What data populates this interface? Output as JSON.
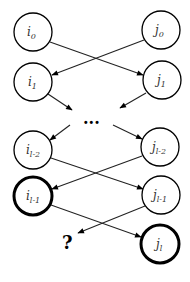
{
  "diagram": {
    "title": "",
    "nodes": [
      {
        "id": "i0",
        "base": "i",
        "sub": "0",
        "x": 33,
        "y": 32,
        "bold": false
      },
      {
        "id": "j0",
        "base": "j",
        "sub": "0",
        "x": 161,
        "y": 30,
        "bold": false
      },
      {
        "id": "i1",
        "base": "i",
        "sub": "1",
        "x": 33,
        "y": 82,
        "bold": false
      },
      {
        "id": "j1",
        "base": "j",
        "sub": "1",
        "x": 162,
        "y": 80,
        "bold": false
      },
      {
        "id": "il-2",
        "base": "i",
        "sub": "l-2",
        "x": 33,
        "y": 150,
        "bold": false
      },
      {
        "id": "jl-2",
        "base": "j",
        "sub": "l-2",
        "x": 160,
        "y": 147,
        "bold": false
      },
      {
        "id": "il-1",
        "base": "i",
        "sub": "l-1",
        "x": 33,
        "y": 196,
        "bold": true
      },
      {
        "id": "jl-1",
        "base": "j",
        "sub": "l-1",
        "x": 161,
        "y": 195,
        "bold": false
      },
      {
        "id": "jl",
        "base": "j",
        "sub": "l",
        "x": 160,
        "y": 244,
        "bold": true
      }
    ],
    "edges": [
      {
        "from": "i0",
        "to": "j1"
      },
      {
        "from": "j0",
        "to": "i1"
      },
      {
        "from": "i1",
        "to": "ellipsis"
      },
      {
        "from": "j1",
        "to": "ellipsis"
      },
      {
        "from": "ellipsis",
        "to": "il-2"
      },
      {
        "from": "ellipsis",
        "to": "jl-2"
      },
      {
        "from": "il-2",
        "to": "jl-1"
      },
      {
        "from": "jl-2",
        "to": "il-1"
      },
      {
        "from": "il-1",
        "to": "jl"
      },
      {
        "from": "jl-1",
        "to": "question"
      }
    ],
    "ellipsis_label": "...",
    "question_label": "?",
    "labels": {
      "i0": {
        "base": "i",
        "sub": "0"
      },
      "j0": {
        "base": "j",
        "sub": "0"
      },
      "i1": {
        "base": "i",
        "sub": "1"
      },
      "j1": {
        "base": "j",
        "sub": "1"
      },
      "il2": {
        "base": "i",
        "sub": "l-2"
      },
      "jl2": {
        "base": "j",
        "sub": "l-2"
      },
      "il1": {
        "base": "i",
        "sub": "l-1"
      },
      "jl1": {
        "base": "j",
        "sub": "l-1"
      },
      "jl": {
        "base": "j",
        "sub": "l"
      }
    }
  }
}
